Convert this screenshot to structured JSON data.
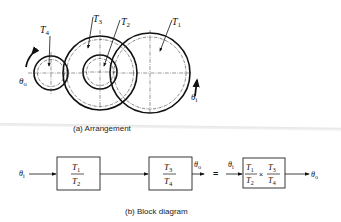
{
  "arrangement": {
    "caption": "(a)  Arrangement",
    "gears": [
      {
        "id": "T4",
        "label": "T",
        "sub": "4"
      },
      {
        "id": "T3",
        "label": "T",
        "sub": "3"
      },
      {
        "id": "T2",
        "label": "T",
        "sub": "2"
      },
      {
        "id": "T1",
        "label": "T",
        "sub": "1"
      }
    ],
    "output_label": {
      "sym": "θ",
      "sub": "o"
    },
    "input_label": {
      "sym": "θ",
      "sub": "i"
    }
  },
  "block_diagram": {
    "caption": "(b)  Block diagram",
    "input": {
      "sym": "θ",
      "sub": "i"
    },
    "block1": {
      "num": {
        "sym": "T",
        "sub": "1"
      },
      "den": {
        "sym": "T",
        "sub": "2"
      }
    },
    "block2": {
      "num": {
        "sym": "T",
        "sub": "3"
      },
      "den": {
        "sym": "T",
        "sub": "4"
      }
    },
    "mid_output": {
      "sym": "θ",
      "sub": "o"
    },
    "equals": "=",
    "combined_input": {
      "sym": "θ",
      "sub": "i"
    },
    "combined": {
      "left": {
        "num": {
          "sym": "T",
          "sub": "1"
        },
        "den": {
          "sym": "T",
          "sub": "2"
        }
      },
      "op": "×",
      "right": {
        "num": {
          "sym": "T",
          "sub": "3"
        },
        "den": {
          "sym": "T",
          "sub": "4"
        }
      }
    },
    "final_output": {
      "sym": "θ",
      "sub": "o"
    }
  }
}
